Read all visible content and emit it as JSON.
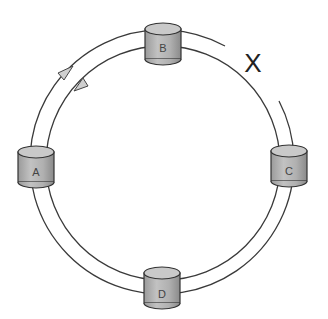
{
  "diagram": {
    "type": "dual-ring-topology",
    "fault_marker": "X",
    "nodes": [
      {
        "id": "B",
        "label": "B",
        "position": "top"
      },
      {
        "id": "A",
        "label": "A",
        "position": "left"
      },
      {
        "id": "C",
        "label": "C",
        "position": "right"
      },
      {
        "id": "D",
        "label": "D",
        "position": "bottom"
      }
    ],
    "rings": [
      {
        "name": "outer-ring",
        "direction": "clockwise"
      },
      {
        "name": "inner-ring",
        "direction": "counter-clockwise"
      }
    ],
    "break": {
      "between": [
        "B",
        "C"
      ],
      "ring": "outer-ring"
    },
    "colors": {
      "node_fill": "#b5b5b5",
      "node_top": "#c9c9c9",
      "line": "#3a3a3a",
      "background": "#ffffff"
    }
  }
}
